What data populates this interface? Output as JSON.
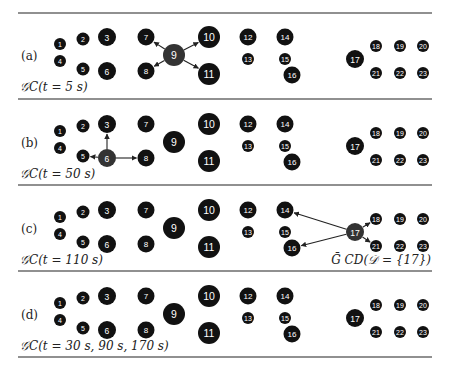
{
  "figure": {
    "separator_color": "#222222",
    "node_color": "#111111",
    "active_node_color": "#333333",
    "panels": [
      {
        "label": "(a)",
        "caption": "𝒢C(t = 5 s)",
        "active": 9,
        "edges": [
          [
            9,
            7
          ],
          [
            9,
            8
          ],
          [
            9,
            10
          ],
          [
            9,
            11
          ]
        ],
        "extra_caption": ""
      },
      {
        "label": "(b)",
        "caption": "𝒢C(t = 50 s)",
        "active": 6,
        "edges": [
          [
            6,
            3
          ],
          [
            6,
            5
          ],
          [
            6,
            8
          ]
        ],
        "extra_caption": ""
      },
      {
        "label": "(c)",
        "caption": "𝒢C(t = 110 s)",
        "active": 17,
        "edges": [
          [
            17,
            14
          ],
          [
            17,
            16
          ],
          [
            17,
            18
          ],
          [
            17,
            21
          ]
        ],
        "extra_caption": "Ḡ CD(𝒟 = {17})"
      },
      {
        "label": "(d)",
        "caption": "𝒢C(t = 30 s, 90 s, 170 s)",
        "active": null,
        "edges": [],
        "extra_caption": ""
      }
    ],
    "nodes": [
      {
        "id": 1,
        "x": 60,
        "y": 44,
        "r": 6
      },
      {
        "id": 2,
        "x": 83,
        "y": 39,
        "r": 6.5
      },
      {
        "id": 3,
        "x": 107,
        "y": 37,
        "r": 9
      },
      {
        "id": 4,
        "x": 60,
        "y": 61,
        "r": 6
      },
      {
        "id": 5,
        "x": 83,
        "y": 69,
        "r": 6.5
      },
      {
        "id": 6,
        "x": 107,
        "y": 71,
        "r": 9
      },
      {
        "id": 7,
        "x": 146,
        "y": 37,
        "r": 8.5
      },
      {
        "id": 8,
        "x": 146,
        "y": 71,
        "r": 8.5
      },
      {
        "id": 9,
        "x": 174,
        "y": 55,
        "r": 11
      },
      {
        "id": 10,
        "x": 209,
        "y": 37,
        "r": 11
      },
      {
        "id": 11,
        "x": 209,
        "y": 74,
        "r": 11
      },
      {
        "id": 12,
        "x": 248,
        "y": 37,
        "r": 8.5
      },
      {
        "id": 13,
        "x": 248,
        "y": 59,
        "r": 6
      },
      {
        "id": 14,
        "x": 285,
        "y": 37,
        "r": 8.5
      },
      {
        "id": 15,
        "x": 285,
        "y": 59,
        "r": 6
      },
      {
        "id": 16,
        "x": 292,
        "y": 75,
        "r": 8.5
      },
      {
        "id": 17,
        "x": 355,
        "y": 59,
        "r": 9
      },
      {
        "id": 18,
        "x": 376,
        "y": 46,
        "r": 6
      },
      {
        "id": 19,
        "x": 400,
        "y": 46,
        "r": 6
      },
      {
        "id": 20,
        "x": 423,
        "y": 46,
        "r": 6
      },
      {
        "id": 21,
        "x": 376,
        "y": 73,
        "r": 6
      },
      {
        "id": 22,
        "x": 400,
        "y": 73,
        "r": 6
      },
      {
        "id": 23,
        "x": 423,
        "y": 73,
        "r": 6
      }
    ]
  }
}
